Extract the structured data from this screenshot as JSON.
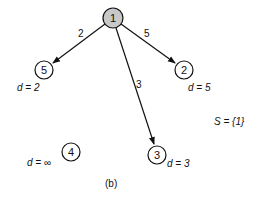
{
  "diagram": {
    "caption": "(b)",
    "set_label": "S = {1}",
    "nodes": [
      {
        "id": "1",
        "label": "1",
        "x": 113,
        "y": 18,
        "filled": true,
        "fill": "#c8c8c8",
        "distance": null
      },
      {
        "id": "5",
        "label": "5",
        "x": 44,
        "y": 70,
        "filled": false,
        "fill": "#ffffff",
        "distance": "d = 2"
      },
      {
        "id": "2",
        "label": "2",
        "x": 184,
        "y": 70,
        "filled": false,
        "fill": "#ffffff",
        "distance": "d = 5"
      },
      {
        "id": "3",
        "label": "3",
        "x": 157,
        "y": 155,
        "filled": false,
        "fill": "#ffffff",
        "distance": "d = 3"
      },
      {
        "id": "4",
        "label": "4",
        "x": 71,
        "y": 152,
        "filled": false,
        "fill": "#ffffff",
        "distance": "d = ∞"
      }
    ],
    "edges": [
      {
        "from": "1",
        "to": "5",
        "weight": "2"
      },
      {
        "from": "1",
        "to": "2",
        "weight": "5"
      },
      {
        "from": "1",
        "to": "3",
        "weight": "3"
      }
    ]
  }
}
